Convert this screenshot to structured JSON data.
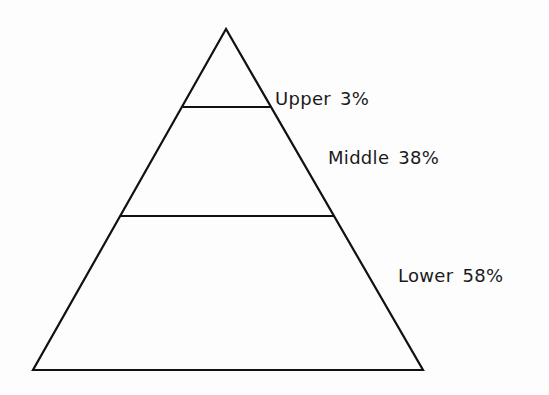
{
  "diagram": {
    "type": "pyramid",
    "line_color": "#111111",
    "levels": [
      {
        "name": "Upper",
        "percent": "3%"
      },
      {
        "name": "Middle",
        "percent": "38%"
      },
      {
        "name": "Lower",
        "percent": "58%"
      }
    ]
  }
}
